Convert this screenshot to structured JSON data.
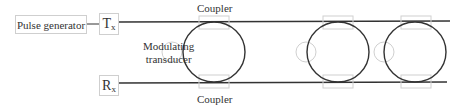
{
  "diagram": {
    "pulse_generator": "Pulse generator",
    "tx": {
      "main": "T",
      "sub": "x"
    },
    "rx": {
      "main": "R",
      "sub": "x"
    },
    "modulating_transducer": [
      "Modulating",
      "transducer"
    ],
    "coupler_top": "Coupler",
    "coupler_bottom": "Coupler"
  },
  "colors": {
    "line": "#333333",
    "faint": "#cfcfcf",
    "text": "#333333"
  }
}
